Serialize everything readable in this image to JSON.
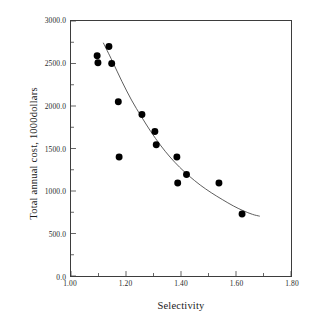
{
  "chart_data": {
    "type": "scatter",
    "title": "",
    "xlabel": "Selectivity",
    "ylabel": "Total annual cost, 1000dollars",
    "xlim": [
      1.0,
      1.8
    ],
    "ylim": [
      0.0,
      3000.0
    ],
    "xticks": [
      "1.00",
      "1.20",
      "1.40",
      "1.60",
      "1.80"
    ],
    "xtick_values": [
      1.0,
      1.2,
      1.4,
      1.6,
      1.8
    ],
    "xminor_values": [
      1.1,
      1.3,
      1.5,
      1.7
    ],
    "yticks": [
      "0.0",
      "500.0",
      "1000.0",
      "1500.0",
      "2000.0",
      "2500.0",
      "3000.0"
    ],
    "ytick_values": [
      0,
      500,
      1000,
      1500,
      2000,
      2500,
      3000
    ],
    "yminor_values": [
      250,
      750,
      1250,
      1750,
      2250,
      2750
    ],
    "grid": false,
    "legend": null,
    "marker": "filled-circle",
    "marker_color": "#000000",
    "line_color": "#4a4a4a",
    "frame_color": "#3d3d3d",
    "points": [
      {
        "x": 1.095,
        "y": 2590
      },
      {
        "x": 1.098,
        "y": 2510
      },
      {
        "x": 1.138,
        "y": 2700
      },
      {
        "x": 1.148,
        "y": 2500
      },
      {
        "x": 1.172,
        "y": 2050
      },
      {
        "x": 1.175,
        "y": 1400
      },
      {
        "x": 1.258,
        "y": 1900
      },
      {
        "x": 1.305,
        "y": 1700
      },
      {
        "x": 1.31,
        "y": 1545
      },
      {
        "x": 1.385,
        "y": 1400
      },
      {
        "x": 1.388,
        "y": 1095
      },
      {
        "x": 1.42,
        "y": 1195
      },
      {
        "x": 1.538,
        "y": 1095
      },
      {
        "x": 1.622,
        "y": 730
      }
    ],
    "fit_curve": [
      {
        "x": 1.118,
        "y": 2740
      },
      {
        "x": 1.15,
        "y": 2530
      },
      {
        "x": 1.185,
        "y": 2290
      },
      {
        "x": 1.22,
        "y": 2070
      },
      {
        "x": 1.255,
        "y": 1880
      },
      {
        "x": 1.29,
        "y": 1700
      },
      {
        "x": 1.325,
        "y": 1540
      },
      {
        "x": 1.36,
        "y": 1400
      },
      {
        "x": 1.395,
        "y": 1280
      },
      {
        "x": 1.43,
        "y": 1175
      },
      {
        "x": 1.47,
        "y": 1070
      },
      {
        "x": 1.51,
        "y": 980
      },
      {
        "x": 1.55,
        "y": 900
      },
      {
        "x": 1.59,
        "y": 825
      },
      {
        "x": 1.625,
        "y": 770
      },
      {
        "x": 1.66,
        "y": 725
      },
      {
        "x": 1.685,
        "y": 705
      }
    ]
  }
}
